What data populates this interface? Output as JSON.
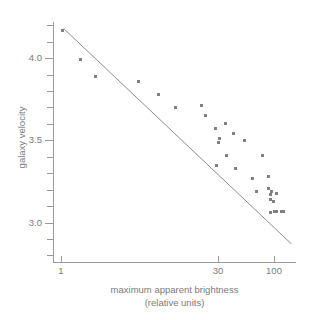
{
  "chart_data": {
    "type": "scatter",
    "title": "",
    "xlabel": "maximum apparent brightness",
    "xlabel_line2": "(relative units)",
    "ylabel": "galaxy velocity",
    "x_scale": "log",
    "y_scale": "linear",
    "xlim": [
      0.85,
      160
    ],
    "ylim": [
      2.76,
      4.22
    ],
    "grid": false,
    "legend": null,
    "x_ticks_labeled": [
      {
        "value": 1,
        "label": "1"
      },
      {
        "value": 30,
        "label": "30"
      },
      {
        "value": 100,
        "label": "100"
      }
    ],
    "y_ticks_labeled": [
      {
        "value": 4.0,
        "label": "4.0"
      },
      {
        "value": 3.5,
        "label": "3.5"
      },
      {
        "value": 3.0,
        "label": "3.0"
      }
    ],
    "y_ticks_minor": [
      4.4,
      4.3,
      4.2,
      4.1,
      3.9,
      3.8,
      3.7,
      3.6,
      3.4,
      3.3,
      3.2,
      3.1,
      2.9,
      2.8
    ],
    "marker": {
      "shape": "square",
      "size_px": 3,
      "color": "#808080"
    },
    "trendline": {
      "show": true,
      "color": "#8c8c8c",
      "width_px": 1,
      "start": {
        "x": 1.07,
        "y": 4.18
      },
      "end": {
        "x": 145,
        "y": 2.87
      }
    },
    "points": [
      {
        "x": 1.05,
        "y": 4.17
      },
      {
        "x": 1.55,
        "y": 3.99
      },
      {
        "x": 2.1,
        "y": 3.89
      },
      {
        "x": 5.4,
        "y": 3.86
      },
      {
        "x": 8.2,
        "y": 3.78
      },
      {
        "x": 12.0,
        "y": 3.7
      },
      {
        "x": 21.0,
        "y": 3.71
      },
      {
        "x": 22.5,
        "y": 3.65
      },
      {
        "x": 28.0,
        "y": 3.57
      },
      {
        "x": 30.5,
        "y": 3.51
      },
      {
        "x": 30.0,
        "y": 3.49
      },
      {
        "x": 29.0,
        "y": 3.35
      },
      {
        "x": 35.0,
        "y": 3.6
      },
      {
        "x": 36.0,
        "y": 3.41
      },
      {
        "x": 42.0,
        "y": 3.54
      },
      {
        "x": 43.0,
        "y": 3.33
      },
      {
        "x": 53.0,
        "y": 3.5
      },
      {
        "x": 62.0,
        "y": 3.27
      },
      {
        "x": 68.0,
        "y": 3.19
      },
      {
        "x": 78.0,
        "y": 3.41
      },
      {
        "x": 88.0,
        "y": 3.28
      },
      {
        "x": 89.0,
        "y": 3.21
      },
      {
        "x": 92.0,
        "y": 3.17
      },
      {
        "x": 93.0,
        "y": 3.14
      },
      {
        "x": 94.0,
        "y": 3.19
      },
      {
        "x": 92.0,
        "y": 3.06
      },
      {
        "x": 99.0,
        "y": 3.13
      },
      {
        "x": 100.0,
        "y": 3.07
      },
      {
        "x": 104.0,
        "y": 3.18
      },
      {
        "x": 106.0,
        "y": 3.07
      },
      {
        "x": 118.0,
        "y": 3.07
      },
      {
        "x": 122.0,
        "y": 3.07
      }
    ]
  }
}
